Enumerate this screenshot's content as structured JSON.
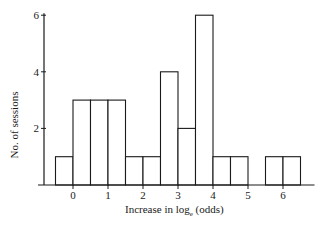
{
  "chart_data": {
    "type": "bar",
    "subtype": "histogram",
    "title": "",
    "xlabel": "Increase in log_e (odds)",
    "ylabel": "No. of sessions",
    "bin_width": 0.5,
    "bins": [
      {
        "start": -0.5,
        "end": 0.0,
        "count": 1
      },
      {
        "start": 0.0,
        "end": 0.5,
        "count": 3
      },
      {
        "start": 0.5,
        "end": 1.0,
        "count": 3
      },
      {
        "start": 1.0,
        "end": 1.5,
        "count": 3
      },
      {
        "start": 1.5,
        "end": 2.0,
        "count": 1
      },
      {
        "start": 2.0,
        "end": 2.5,
        "count": 1
      },
      {
        "start": 2.5,
        "end": 3.0,
        "count": 4
      },
      {
        "start": 3.0,
        "end": 3.5,
        "count": 2
      },
      {
        "start": 3.5,
        "end": 4.0,
        "count": 6
      },
      {
        "start": 4.0,
        "end": 4.5,
        "count": 1
      },
      {
        "start": 4.5,
        "end": 5.0,
        "count": 1
      },
      {
        "start": 5.0,
        "end": 5.5,
        "count": 0
      },
      {
        "start": 5.5,
        "end": 6.0,
        "count": 1
      },
      {
        "start": 6.0,
        "end": 6.5,
        "count": 1
      }
    ],
    "x_ticks": [
      0,
      1,
      2,
      3,
      4,
      5,
      6
    ],
    "y_ticks": [
      2,
      4,
      6
    ],
    "xlim": [
      -0.85,
      6.9
    ],
    "ylim": [
      0,
      6
    ],
    "grid": false,
    "legend": null,
    "bar_fill": "#ffffff",
    "bar_stroke": "#1a1a1a"
  },
  "labels": {
    "ylabel": "No. of sessions",
    "xlabel_main": "Increase in log",
    "xlabel_sub": "e",
    "xlabel_tail": " (odds)"
  }
}
